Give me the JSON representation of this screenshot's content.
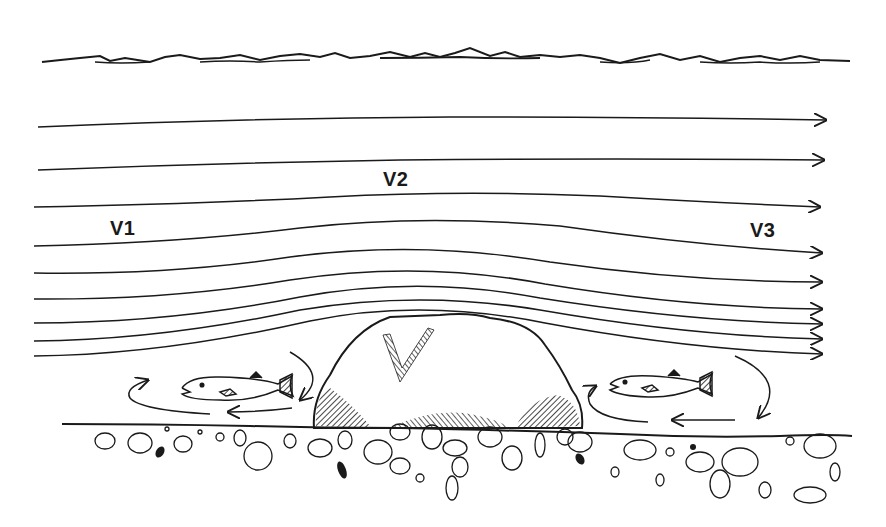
{
  "diagram": {
    "type": "flow-around-boulder",
    "ink_color": "#1a1a1a",
    "background": "#ffffff",
    "labels": {
      "v1": "V1",
      "v2": "V2",
      "v3": "V3"
    },
    "elements": {
      "surface": "water-surface-waves",
      "streamlines": 11,
      "boulder": "boulder",
      "fish_upstream": "fish-upstream-eddy",
      "fish_downstream": "fish-downstream-eddy",
      "bed": "gravel-streambed"
    }
  }
}
